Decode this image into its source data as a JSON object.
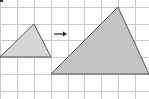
{
  "diagram": {
    "type": "dilation-on-grid",
    "grid": {
      "cell_px": 16.8,
      "line_color": "#c8c8c8"
    },
    "arrow": {
      "direction": "right",
      "color": "#222222"
    },
    "shapes": [
      {
        "name": "original-triangle",
        "points": [
          [
            0,
            57
          ],
          [
            34,
            24
          ],
          [
            51,
            57
          ]
        ],
        "fill": "#d6d6d6",
        "stroke": "#555555"
      },
      {
        "name": "image-triangle",
        "points": [
          [
            51,
            74
          ],
          [
            118,
            7
          ],
          [
            149,
            74
          ]
        ],
        "fill": "#c4c4c4",
        "stroke": "#555555"
      }
    ]
  }
}
